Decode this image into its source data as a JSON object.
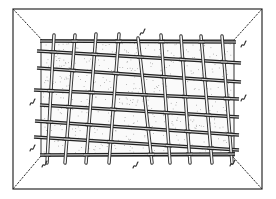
{
  "figure": {
    "colors": {
      "ink": "#222222",
      "paper": "#ffffff",
      "stipple": "#9a9a9a"
    },
    "outer_frame": {
      "x1": 13,
      "y1": 9,
      "x2": 262,
      "y2": 189
    },
    "inner_rect": {
      "x1": 41,
      "y1": 40,
      "x2": 234,
      "y2": 156
    },
    "corner_lines": [
      {
        "from": [
          13,
          9
        ],
        "to": [
          42,
          40
        ]
      },
      {
        "from": [
          262,
          9
        ],
        "to": [
          234,
          40
        ]
      },
      {
        "from": [
          13,
          189
        ],
        "to": [
          41,
          156
        ]
      },
      {
        "from": [
          262,
          189
        ],
        "to": [
          233,
          157
        ]
      }
    ],
    "horizontal_rods": [
      {
        "from": [
          40,
          41
        ],
        "to": [
          236,
          42
        ]
      },
      {
        "from": [
          37,
          51
        ],
        "to": [
          241,
          63
        ]
      },
      {
        "from": [
          37,
          68
        ],
        "to": [
          241,
          82
        ]
      },
      {
        "from": [
          34,
          90
        ],
        "to": [
          239,
          99
        ]
      },
      {
        "from": [
          40,
          105
        ],
        "to": [
          239,
          117
        ]
      },
      {
        "from": [
          35,
          121
        ],
        "to": [
          239,
          135
        ]
      },
      {
        "from": [
          34,
          137
        ],
        "to": [
          239,
          150
        ]
      },
      {
        "from": [
          40,
          155
        ],
        "to": [
          235,
          154
        ]
      }
    ],
    "vertical_rods": [
      {
        "from": [
          54,
          35
        ],
        "to": [
          47,
          163
        ]
      },
      {
        "from": [
          75,
          35
        ],
        "to": [
          65,
          163
        ]
      },
      {
        "from": [
          96,
          34
        ],
        "to": [
          86,
          163
        ]
      },
      {
        "from": [
          119,
          34
        ],
        "to": [
          109,
          163
        ]
      },
      {
        "from": [
          138,
          38
        ],
        "to": [
          152,
          163
        ]
      },
      {
        "from": [
          161,
          35
        ],
        "to": [
          170,
          163
        ]
      },
      {
        "from": [
          181,
          36
        ],
        "to": [
          190,
          163
        ]
      },
      {
        "from": [
          201,
          36
        ],
        "to": [
          212,
          163
        ]
      },
      {
        "from": [
          222,
          36
        ],
        "to": [
          232,
          163
        ]
      }
    ],
    "squiggles": [
      {
        "x": 142,
        "y": 32
      },
      {
        "x": 243,
        "y": 44
      },
      {
        "x": 243,
        "y": 98
      },
      {
        "x": 32,
        "y": 102
      },
      {
        "x": 32,
        "y": 148
      },
      {
        "x": 44,
        "y": 164
      },
      {
        "x": 135,
        "y": 165
      },
      {
        "x": 232,
        "y": 163
      }
    ]
  }
}
